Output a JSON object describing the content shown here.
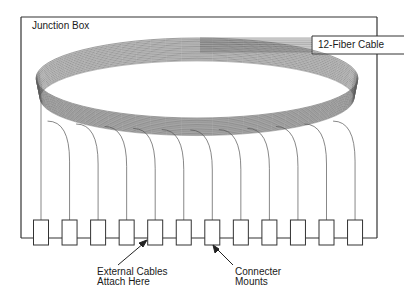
{
  "diagram": {
    "title": "Junction Box",
    "cable_label": "12-Fiber Cable",
    "fiber_count": 12,
    "connector_count": 12,
    "annotations": {
      "external_cables": {
        "line1": "External Cables",
        "line2": "Attach Here"
      },
      "connector_mounts": {
        "line1": "Connecter",
        "line2": "Mounts"
      }
    },
    "colors": {
      "line": "#333333",
      "fiber": "#555555",
      "background": "#ffffff"
    }
  }
}
